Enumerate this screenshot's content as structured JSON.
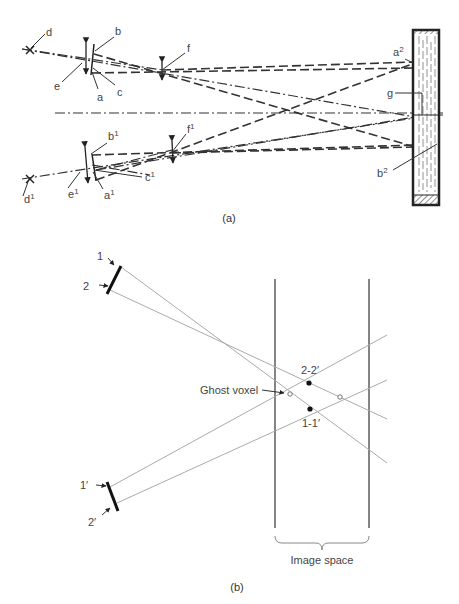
{
  "panel_a": {
    "caption": "(a)",
    "labels": {
      "d": "d",
      "b": "b",
      "e": "e",
      "a": "a",
      "c": "c",
      "f": "f",
      "a2": "a",
      "a2_sup": "2",
      "g": "g",
      "b2": "b",
      "b2_sup": "2",
      "b1": "b",
      "b1_sup": "1",
      "f1": "f",
      "f1_sup": "1",
      "e1": "e",
      "e1_sup": "1",
      "a1": "a",
      "a1_sup": "1",
      "c1": "c",
      "c1_sup": "1",
      "d1": "d",
      "d1_sup": "1"
    }
  },
  "panel_b": {
    "caption": "(b)",
    "labels": {
      "det1": "1",
      "det2": "2",
      "det1p": "1′",
      "det2p": "2′",
      "ghost": "Ghost voxel",
      "top_point": "2-2′",
      "bottom_point": "1-1′",
      "image_space": "Image space"
    }
  }
}
